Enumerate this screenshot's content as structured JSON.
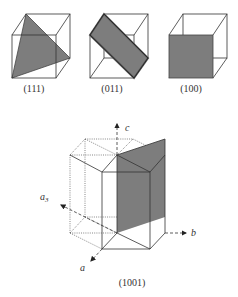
{
  "figure": {
    "cubes": [
      {
        "id": "cube-111",
        "label": "(111)"
      },
      {
        "id": "cube-011",
        "label": "(011)"
      },
      {
        "id": "cube-100",
        "label": "(100)"
      }
    ],
    "hexagonal": {
      "label": "(1001)",
      "axes": {
        "c": "c",
        "a3": "a",
        "a3_sub": "3",
        "b": "b",
        "a": "a"
      }
    },
    "colors": {
      "plane_fill": "#7d7d7d",
      "edge": "#333333",
      "background": "#ffffff"
    }
  }
}
